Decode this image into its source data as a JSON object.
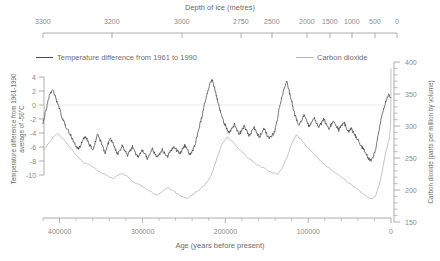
{
  "chart_data": {
    "type": "line",
    "title": "Depth of ice (metres)",
    "top_axis": {
      "label": "Depth of ice (metres)",
      "ticks": [
        "3300",
        "3200",
        "3000",
        "2750",
        "2500",
        "2000",
        "1500",
        "1000",
        "500",
        "0"
      ],
      "tick_positions_px": [
        43,
        112,
        182,
        241,
        272,
        307,
        330,
        352,
        375,
        397
      ]
    },
    "xlabel": "Age (years before present)",
    "x_ticks": [
      "400000",
      "300000",
      "200000",
      "100000",
      "0"
    ],
    "xlim": [
      420000,
      0
    ],
    "ylabel_left": "Temperature difference from 1961-1990 average of -56°C",
    "y_ticks_left": [
      "4",
      "2",
      "0",
      "-2",
      "-4",
      "-6",
      "-8",
      "-10"
    ],
    "ylim_left": [
      -10,
      4
    ],
    "ylabel_right": "Carbon dioxide (parts per million by volume)",
    "y_ticks_right": [
      "400",
      "350",
      "300",
      "250",
      "200",
      "150"
    ],
    "ylim_right": [
      150,
      400
    ],
    "grid": "single horizontal line at temperature 0",
    "legend_position": "top",
    "legend": [
      {
        "name": "Temperature difference from 1961 to 1990",
        "color": "#3c3c3c"
      },
      {
        "name": "Carbon dioxide",
        "color": "#b0b0b0"
      }
    ],
    "series": [
      {
        "name": "Temperature difference from 1961 to 1990",
        "color": "#3c3c3c",
        "unit": "°C",
        "x": [
          420000,
          417000,
          414000,
          411000,
          408000,
          405000,
          402000,
          399000,
          396000,
          393000,
          390000,
          387000,
          384000,
          381000,
          378000,
          375000,
          372000,
          369000,
          366000,
          363000,
          360000,
          357000,
          354000,
          351000,
          348000,
          345000,
          342000,
          339000,
          336000,
          333000,
          330000,
          327000,
          324000,
          321000,
          318000,
          315000,
          312000,
          309000,
          306000,
          303000,
          300000,
          297000,
          294000,
          291000,
          288000,
          285000,
          282000,
          279000,
          276000,
          273000,
          270000,
          267000,
          264000,
          261000,
          258000,
          255000,
          252000,
          249000,
          246000,
          243000,
          240000,
          237000,
          234000,
          231000,
          228000,
          225000,
          222000,
          219000,
          216000,
          213000,
          210000,
          207000,
          204000,
          201000,
          198000,
          195000,
          192000,
          189000,
          186000,
          183000,
          180000,
          177000,
          174000,
          171000,
          168000,
          165000,
          162000,
          159000,
          156000,
          153000,
          150000,
          147000,
          144000,
          141000,
          138000,
          135000,
          132000,
          129000,
          126000,
          123000,
          120000,
          117000,
          114000,
          111000,
          108000,
          105000,
          102000,
          99000,
          96000,
          93000,
          90000,
          87000,
          84000,
          81000,
          78000,
          75000,
          72000,
          69000,
          66000,
          63000,
          60000,
          57000,
          54000,
          51000,
          48000,
          45000,
          42000,
          39000,
          36000,
          33000,
          30000,
          27000,
          24000,
          21000,
          18000,
          15000,
          12000,
          9000,
          6000,
          3000,
          0
        ],
        "y": [
          -2.5,
          -1.0,
          0.5,
          1.8,
          2.2,
          1.2,
          0.0,
          -1.0,
          -2.0,
          -3.0,
          -3.5,
          -4.2,
          -5.0,
          -5.6,
          -6.2,
          -6.0,
          -5.0,
          -4.4,
          -5.2,
          -5.8,
          -6.5,
          -5.4,
          -4.2,
          -5.0,
          -6.0,
          -6.8,
          -5.8,
          -4.6,
          -5.4,
          -6.2,
          -7.0,
          -6.4,
          -5.8,
          -6.6,
          -7.2,
          -6.6,
          -6.0,
          -6.8,
          -7.4,
          -7.0,
          -6.4,
          -7.0,
          -7.6,
          -7.0,
          -6.3,
          -6.9,
          -7.5,
          -7.0,
          -6.4,
          -7.0,
          -7.4,
          -6.8,
          -6.2,
          -6.0,
          -6.6,
          -7.0,
          -6.4,
          -5.8,
          -6.4,
          -7.0,
          -6.6,
          -5.8,
          -4.5,
          -3.0,
          -1.5,
          0.2,
          1.6,
          2.8,
          3.6,
          2.4,
          1.0,
          -0.5,
          -1.8,
          -2.6,
          -3.4,
          -4.0,
          -3.4,
          -2.8,
          -3.6,
          -4.2,
          -3.6,
          -3.0,
          -3.8,
          -4.4,
          -3.8,
          -3.2,
          -4.0,
          -4.6,
          -4.0,
          -3.4,
          -4.2,
          -4.8,
          -4.4,
          -4.0,
          -2.5,
          -0.5,
          1.0,
          2.4,
          3.4,
          2.0,
          0.6,
          -1.0,
          -2.2,
          -3.0,
          -2.2,
          -1.4,
          -2.2,
          -3.0,
          -2.4,
          -1.8,
          -2.6,
          -3.2,
          -2.6,
          -2.0,
          -2.8,
          -3.4,
          -2.8,
          -2.2,
          -3.0,
          -3.6,
          -3.0,
          -2.4,
          -3.2,
          -3.8,
          -3.4,
          -4.0,
          -4.6,
          -5.2,
          -5.8,
          -6.4,
          -7.0,
          -7.6,
          -8.0,
          -7.2,
          -6.0,
          -4.0,
          -2.0,
          -0.5,
          0.6,
          1.4,
          1.0
        ]
      },
      {
        "name": "Carbon dioxide",
        "color": "#b0b0b0",
        "unit": "ppmv",
        "x": [
          420000,
          414000,
          408000,
          402000,
          396000,
          390000,
          384000,
          378000,
          372000,
          366000,
          360000,
          354000,
          348000,
          342000,
          336000,
          330000,
          324000,
          318000,
          312000,
          306000,
          300000,
          294000,
          288000,
          282000,
          276000,
          270000,
          264000,
          258000,
          252000,
          246000,
          240000,
          234000,
          228000,
          222000,
          216000,
          210000,
          204000,
          198000,
          192000,
          186000,
          180000,
          174000,
          168000,
          162000,
          156000,
          150000,
          144000,
          138000,
          132000,
          126000,
          120000,
          114000,
          108000,
          102000,
          96000,
          90000,
          84000,
          78000,
          72000,
          66000,
          60000,
          54000,
          48000,
          42000,
          36000,
          30000,
          24000,
          18000,
          12000,
          6000,
          2000,
          500,
          100,
          0
        ],
        "y": [
          262,
          272,
          282,
          288,
          280,
          270,
          262,
          252,
          244,
          240,
          236,
          230,
          226,
          222,
          218,
          222,
          226,
          220,
          214,
          210,
          206,
          200,
          196,
          192,
          198,
          204,
          200,
          194,
          190,
          186,
          192,
          198,
          204,
          212,
          226,
          250,
          272,
          282,
          276,
          268,
          260,
          252,
          246,
          240,
          236,
          232,
          228,
          224,
          232,
          250,
          272,
          286,
          278,
          268,
          260,
          252,
          244,
          238,
          232,
          226,
          220,
          214,
          208,
          202,
          196,
          190,
          186,
          192,
          220,
          260,
          280,
          300,
          340,
          390
        ]
      }
    ]
  },
  "legend": {
    "temperature_label": "Temperature difference from 1961 to 1990",
    "co2_label": "Carbon dioxide"
  },
  "axes": {
    "top_title": "Depth of ice (metres)",
    "bottom_title": "Age (years before present)",
    "left_title": "Temperature difference from 1961-1990 average of -56°C",
    "right_title": "Carbon dioxide (parts per million by volume)"
  },
  "colors": {
    "temperature": "#3c3c3c",
    "co2": "#b0b0b0",
    "axis": "#9a9a9a",
    "text": "#6f6f6f"
  }
}
